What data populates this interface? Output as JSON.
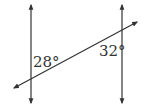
{
  "diagram": {
    "type": "parallel-lines-transversal",
    "colors": {
      "line": "#333333",
      "text": "#333333",
      "background": "#ffffff"
    },
    "lines": [
      {
        "name": "left-vertical-line",
        "x1": 31,
        "y1": 5,
        "x2": 31,
        "y2": 103
      },
      {
        "name": "right-vertical-line",
        "x1": 122,
        "y1": 5,
        "x2": 122,
        "y2": 103
      },
      {
        "name": "transversal-line",
        "x1": 14,
        "y1": 88,
        "x2": 137,
        "y2": 22
      }
    ],
    "angles": [
      {
        "label": "28°",
        "value": 28,
        "x": 33,
        "y": 67
      },
      {
        "label": "32°",
        "value": 32,
        "x": 99,
        "y": 56
      }
    ]
  }
}
